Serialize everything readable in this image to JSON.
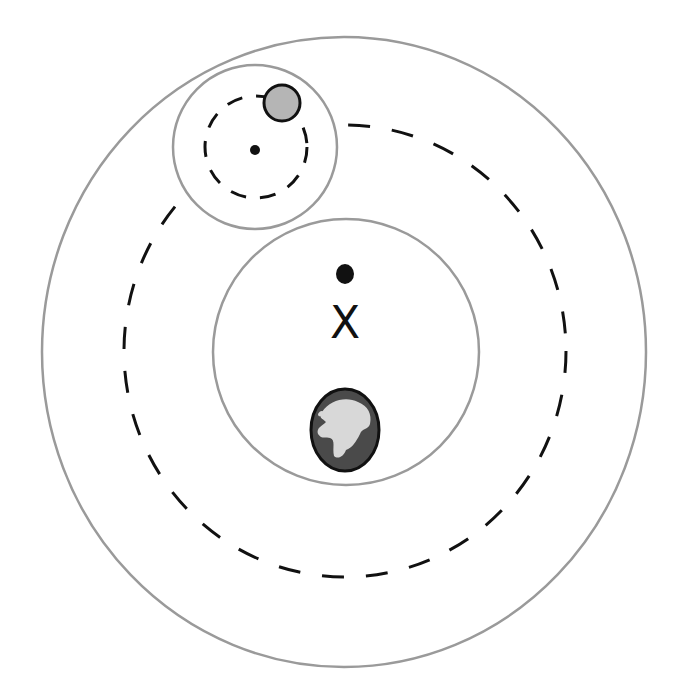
{
  "diagram": {
    "type": "ptolemaic-epicycle-model",
    "labels": {
      "equant_mark": "X"
    },
    "colors": {
      "background": "#ffffff",
      "sphere_outline": "#9a9a9a",
      "orbit_dash": "#111111",
      "planet_fill": "#b5b5b5",
      "earth_ocean": "#4a4a4a",
      "earth_land": "#d8d8d8",
      "point": "#111111"
    },
    "elements": [
      {
        "name": "outer-sphere",
        "shape": "ellipse",
        "style": "solid-gray"
      },
      {
        "name": "deferent-orbit",
        "shape": "ellipse",
        "style": "dashed-black"
      },
      {
        "name": "inner-sphere",
        "shape": "circle",
        "style": "solid-gray"
      },
      {
        "name": "epicycle-sphere",
        "shape": "circle",
        "style": "solid-gray"
      },
      {
        "name": "epicycle-orbit",
        "shape": "circle",
        "style": "dashed-black"
      },
      {
        "name": "epicycle-center",
        "shape": "dot"
      },
      {
        "name": "planet",
        "shape": "circle",
        "style": "gray-fill"
      },
      {
        "name": "deferent-center",
        "shape": "dot"
      },
      {
        "name": "equant",
        "shape": "x-mark"
      },
      {
        "name": "earth",
        "shape": "globe"
      }
    ]
  }
}
